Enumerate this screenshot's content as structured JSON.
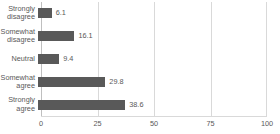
{
  "chart_data": {
    "type": "bar",
    "orientation": "horizontal",
    "title": "",
    "subtitle": "",
    "xlabel": "",
    "ylabel": "",
    "categories": [
      "Strongly disagree",
      "Somewhat disagree",
      "Neutral",
      "Somewhat agree",
      "Strongly agree"
    ],
    "values": [
      6.1,
      16.1,
      9.4,
      29.8,
      38.6
    ],
    "value_labels": [
      "6.1",
      "16.1",
      "9.4",
      "29.8",
      "38.6"
    ],
    "xlim": [
      0,
      100
    ],
    "xticks": [
      0,
      25,
      50,
      75,
      100
    ],
    "xtick_labels": [
      "0",
      "25",
      "50",
      "75",
      "100"
    ],
    "grid": true,
    "grid_axis": "x",
    "legend": false,
    "legend_position": "none",
    "colors": {
      "bar": "#595959",
      "gridline": "#d9d9d9",
      "axis": "#bfbfbf",
      "text": "#595959",
      "background": "#ffffff"
    }
  }
}
